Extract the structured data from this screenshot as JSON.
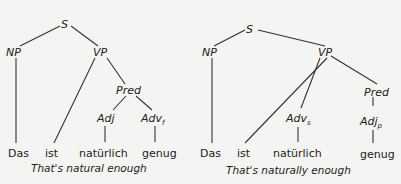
{
  "top_partial_text": "rases ... y",
  "trees": [
    {
      "caption": "That's natural enough",
      "nodes": {
        "S": "S",
        "NP": "NP",
        "VP": "VP",
        "Pred": "Pred",
        "Adj": "Adj",
        "Adv": "Adv",
        "Adv_sub": "f"
      },
      "words": [
        "Das",
        "ist",
        "natürlich",
        "genug"
      ]
    },
    {
      "caption": "That's naturally enough",
      "nodes": {
        "S": "S",
        "NP": "NP",
        "VP": "VP",
        "Adv": "Adv",
        "Adv_sub": "s",
        "Pred": "Pred",
        "Adj": "Adj",
        "Adj_sub": "p"
      },
      "words": [
        "Das",
        "ist",
        "natürlich",
        "genug"
      ]
    }
  ]
}
